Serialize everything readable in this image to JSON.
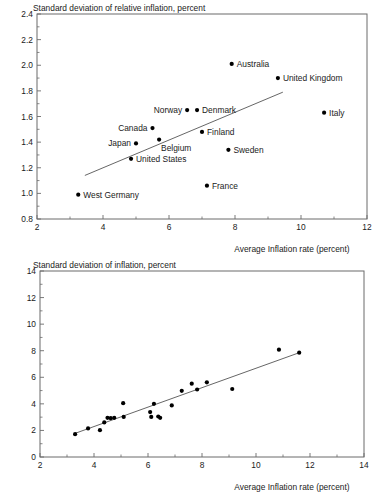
{
  "document": {
    "kind": "two-panel-scatter-figure"
  },
  "chart_data": [
    {
      "id": "relative-inflation",
      "type": "scatter",
      "title": "Standard deviation of relative inflation, percent",
      "xlabel": "Average Inflation rate (percent)",
      "ylabel": "",
      "xlim": [
        2,
        12
      ],
      "ylim": [
        0.8,
        2.4
      ],
      "xticks": [
        2,
        4,
        6,
        8,
        10,
        12
      ],
      "xticks_minor": [
        3,
        5,
        7,
        9,
        11
      ],
      "yticks": [
        0.8,
        1.0,
        1.2,
        1.4,
        1.6,
        1.8,
        2.0,
        2.2,
        2.4
      ],
      "ytick_labels": [
        "0.8",
        "1.0",
        "1.2",
        "1.4",
        "1.6",
        "1.8",
        "2.0",
        "2.2",
        "2.4"
      ],
      "xtick_labels": [
        "2",
        "4",
        "6",
        "8",
        "10",
        "12"
      ],
      "grid": false,
      "legend": "none",
      "points": [
        {
          "label": "West Germany",
          "x": 3.25,
          "y": 0.99,
          "label_side": "right"
        },
        {
          "label": "United States",
          "x": 4.85,
          "y": 1.27,
          "label_side": "right"
        },
        {
          "label": "Japan",
          "x": 5.0,
          "y": 1.39,
          "label_side": "left"
        },
        {
          "label": "Canada",
          "x": 5.5,
          "y": 1.51,
          "label_side": "left"
        },
        {
          "label": "Belgium",
          "x": 5.7,
          "y": 1.42,
          "label_side": "below"
        },
        {
          "label": "Norway",
          "x": 6.55,
          "y": 1.65,
          "label_side": "left"
        },
        {
          "label": "Denmark",
          "x": 6.85,
          "y": 1.65,
          "label_side": "right"
        },
        {
          "label": "Finland",
          "x": 7.0,
          "y": 1.48,
          "label_side": "right"
        },
        {
          "label": "France",
          "x": 7.15,
          "y": 1.06,
          "label_side": "right"
        },
        {
          "label": "Sweden",
          "x": 7.8,
          "y": 1.34,
          "label_side": "right"
        },
        {
          "label": "Australia",
          "x": 7.9,
          "y": 2.01,
          "label_side": "right"
        },
        {
          "label": "United Kingdom",
          "x": 9.3,
          "y": 1.9,
          "label_side": "right"
        },
        {
          "label": "Italy",
          "x": 10.7,
          "y": 1.63,
          "label_side": "right"
        }
      ],
      "trendline": {
        "x0": 3.45,
        "y0": 1.14,
        "x1": 9.45,
        "y1": 1.79
      }
    },
    {
      "id": "absolute-inflation",
      "type": "scatter",
      "title": "Standard deviation of inflation, percent",
      "xlabel": "Average Inflation rate (percent)",
      "ylabel": "",
      "xlim": [
        2,
        14
      ],
      "ylim": [
        0,
        14
      ],
      "xticks": [
        2,
        4,
        6,
        8,
        10,
        12,
        14
      ],
      "xticks_minor": [
        3,
        5,
        7,
        9,
        11,
        13
      ],
      "yticks": [
        0,
        2,
        4,
        6,
        8,
        10,
        12,
        14
      ],
      "ytick_labels": [
        "0",
        "2",
        "4",
        "6",
        "8",
        "10",
        "12",
        "14"
      ],
      "xtick_labels": [
        "2",
        "4",
        "6",
        "8",
        "10",
        "12",
        "14"
      ],
      "grid": false,
      "legend": "none",
      "points": [
        {
          "x": 3.3,
          "y": 1.72
        },
        {
          "x": 3.78,
          "y": 2.15
        },
        {
          "x": 4.22,
          "y": 2.02
        },
        {
          "x": 4.38,
          "y": 2.6
        },
        {
          "x": 4.5,
          "y": 2.95
        },
        {
          "x": 4.62,
          "y": 2.92
        },
        {
          "x": 4.75,
          "y": 2.95
        },
        {
          "x": 5.08,
          "y": 4.05
        },
        {
          "x": 5.1,
          "y": 3.02
        },
        {
          "x": 6.08,
          "y": 3.38
        },
        {
          "x": 6.12,
          "y": 3.02
        },
        {
          "x": 6.22,
          "y": 4.0
        },
        {
          "x": 6.38,
          "y": 3.05
        },
        {
          "x": 6.45,
          "y": 2.95
        },
        {
          "x": 6.88,
          "y": 3.88
        },
        {
          "x": 7.25,
          "y": 4.98
        },
        {
          "x": 7.62,
          "y": 5.52
        },
        {
          "x": 7.82,
          "y": 5.08
        },
        {
          "x": 8.18,
          "y": 5.62
        },
        {
          "x": 9.12,
          "y": 5.12
        },
        {
          "x": 10.85,
          "y": 8.08
        },
        {
          "x": 11.6,
          "y": 7.85
        }
      ],
      "trendline": {
        "x0": 3.3,
        "y0": 1.78,
        "x1": 11.6,
        "y1": 7.85
      }
    }
  ]
}
